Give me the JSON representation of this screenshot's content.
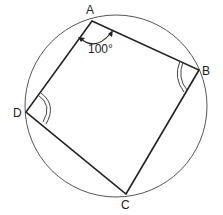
{
  "diagram": {
    "type": "cyclic-quadrilateral",
    "circle": {
      "cx": 116,
      "cy": 106,
      "r": 91,
      "stroke": "#555555"
    },
    "vertices": [
      {
        "name": "A",
        "x": 92,
        "y": 21,
        "label": "A",
        "label_x": 86,
        "label_y": 14
      },
      {
        "name": "B",
        "x": 199,
        "y": 70,
        "label": "B",
        "label_x": 202,
        "label_y": 74
      },
      {
        "name": "C",
        "x": 126,
        "y": 194,
        "label": "C",
        "label_x": 121,
        "label_y": 208
      },
      {
        "name": "D",
        "x": 26,
        "y": 112,
        "label": "D",
        "label_x": 14,
        "label_y": 116
      }
    ],
    "edges": [
      "AB",
      "BC",
      "CD",
      "DA"
    ],
    "angle_marks": {
      "A": {
        "text": "100°",
        "style": "single-arc-with-arrows"
      },
      "B": {
        "style": "double-arc"
      },
      "D": {
        "style": "double-arc"
      }
    },
    "line_color": "#222222"
  }
}
